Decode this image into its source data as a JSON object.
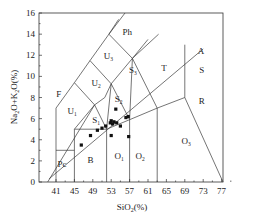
{
  "chart_data": {
    "type": "scatter",
    "title": "",
    "diagram": "TAS (Total Alkali vs Silica) classification diagram",
    "xlabel": "SiO₂(%)",
    "ylabel": "Na₂O+K₂O(%)",
    "xlabel_parts": [
      "SiO",
      "2",
      "(%)"
    ],
    "ylabel_parts": [
      "Na",
      "2",
      "O+K",
      "2",
      "O(%)"
    ],
    "xlim": [
      37.3,
      77.5
    ],
    "ylim": [
      0,
      16
    ],
    "x_ticks": [
      41,
      45,
      49,
      53,
      57,
      61,
      65,
      69,
      73,
      77
    ],
    "y_ticks": [
      0,
      2,
      4,
      6,
      8,
      10,
      12,
      14,
      16
    ],
    "grid": false,
    "legend": null,
    "fields": [
      {
        "name": "Ph",
        "label": "Ph",
        "sub": "",
        "x": 56.5,
        "y": 14.2
      },
      {
        "name": "T",
        "label": "T",
        "sub": "",
        "x": 64.5,
        "y": 10.8
      },
      {
        "name": "A",
        "label": "A",
        "sub": "",
        "x": 72.5,
        "y": 12.4
      },
      {
        "name": "S",
        "label": "S",
        "sub": "",
        "x": 72.7,
        "y": 10.6
      },
      {
        "name": "R",
        "label": "R",
        "sub": "",
        "x": 72.7,
        "y": 7.7
      },
      {
        "name": "U3",
        "label": "U",
        "sub": "3",
        "x": 52.4,
        "y": 11.9
      },
      {
        "name": "U2",
        "label": "U",
        "sub": "2",
        "x": 49.7,
        "y": 9.4
      },
      {
        "name": "U1",
        "label": "U",
        "sub": "1",
        "x": 44.5,
        "y": 6.7
      },
      {
        "name": "F",
        "label": "F",
        "sub": "",
        "x": 41.6,
        "y": 8.3
      },
      {
        "name": "S3",
        "label": "S",
        "sub": "3",
        "x": 57.7,
        "y": 10.6
      },
      {
        "name": "S2",
        "label": "S",
        "sub": "2",
        "x": 54.6,
        "y": 7.9
      },
      {
        "name": "S1",
        "label": "S",
        "sub": "1",
        "x": 49.7,
        "y": 5.9
      },
      {
        "name": "Pc",
        "label": "Pc",
        "sub": "",
        "x": 42.3,
        "y": 1.7
      },
      {
        "name": "B",
        "label": "B",
        "sub": "",
        "x": 48.5,
        "y": 2.1
      },
      {
        "name": "O1",
        "label": "O",
        "sub": "1",
        "x": 54.7,
        "y": 2.5
      },
      {
        "name": "O2",
        "label": "O",
        "sub": "2",
        "x": 59.3,
        "y": 2.5
      },
      {
        "name": "O3",
        "label": "O",
        "sub": "3",
        "x": 69.3,
        "y": 3.9
      }
    ],
    "boundaries": [
      [
        [
          39.2,
          0
        ],
        [
          49.4,
          7.3
        ],
        [
          51.6,
          8.0
        ],
        [
          53.0,
          9.3
        ],
        [
          57.6,
          11.7
        ],
        [
          63.3,
          14.0
        ]
      ],
      [
        [
          41,
          0
        ],
        [
          41,
          7
        ]
      ],
      [
        [
          41,
          3
        ],
        [
          45,
          3
        ]
      ],
      [
        [
          45,
          0
        ],
        [
          45,
          5
        ]
      ],
      [
        [
          45,
          5
        ],
        [
          52,
          5
        ],
        [
          57,
          5.9
        ],
        [
          63,
          7
        ],
        [
          69,
          8
        ],
        [
          77.3,
          0
        ]
      ],
      [
        [
          45,
          5
        ],
        [
          49.4,
          7.3
        ]
      ],
      [
        [
          52,
          0
        ],
        [
          52,
          5
        ],
        [
          49.4,
          7.3
        ],
        [
          45,
          9.4
        ],
        [
          48.4,
          11.5
        ],
        [
          52.5,
          14
        ],
        [
          56,
          16
        ]
      ],
      [
        [
          52,
          5
        ],
        [
          53,
          9.3
        ],
        [
          48.4,
          11.5
        ]
      ],
      [
        [
          57,
          0
        ],
        [
          57,
          5.9
        ],
        [
          53,
          9.3
        ]
      ],
      [
        [
          57,
          5.9
        ],
        [
          57.6,
          11.7
        ],
        [
          52.5,
          14
        ]
      ],
      [
        [
          63,
          0
        ],
        [
          63,
          7
        ],
        [
          57.6,
          11.7
        ]
      ],
      [
        [
          57.6,
          11.7
        ],
        [
          61,
          13.5
        ]
      ],
      [
        [
          69,
          8
        ],
        [
          69,
          13
        ]
      ],
      [
        [
          39.5,
          0.3
        ],
        [
          73.0,
          12.6
        ]
      ],
      [
        [
          41,
          7
        ],
        [
          45,
          9.4
        ]
      ],
      [
        [
          52.5,
          14
        ],
        [
          54.6,
          15.4
        ]
      ]
    ],
    "points": [
      {
        "x": 46.5,
        "y": 3.5
      },
      {
        "x": 48.5,
        "y": 4.4
      },
      {
        "x": 50.0,
        "y": 4.9
      },
      {
        "x": 51.0,
        "y": 5.1
      },
      {
        "x": 51.8,
        "y": 5.3
      },
      {
        "x": 52.8,
        "y": 5.6
      },
      {
        "x": 53.0,
        "y": 5.8
      },
      {
        "x": 53.3,
        "y": 5.5
      },
      {
        "x": 53.6,
        "y": 5.7
      },
      {
        "x": 53.0,
        "y": 4.4
      },
      {
        "x": 54.2,
        "y": 5.6
      },
      {
        "x": 54.0,
        "y": 6.9
      },
      {
        "x": 56.2,
        "y": 6.1
      },
      {
        "x": 56.7,
        "y": 6.2
      },
      {
        "x": 55.0,
        "y": 5.3
      },
      {
        "x": 56.8,
        "y": 4.3
      }
    ]
  }
}
